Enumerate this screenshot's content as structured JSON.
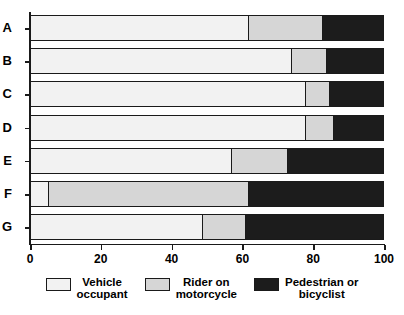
{
  "chart_data": {
    "type": "bar",
    "orientation": "horizontal",
    "stacked": true,
    "normalized_percent": true,
    "title": "",
    "xlabel": "",
    "ylabel": "",
    "xlim": [
      0,
      100
    ],
    "grid": false,
    "legend_position": "bottom",
    "categories": [
      "A",
      "B",
      "C",
      "D",
      "E",
      "F",
      "G"
    ],
    "series": [
      {
        "name": "Vehicle occupant",
        "color": "#f2f2f2",
        "values": [
          62,
          74,
          78,
          78,
          57,
          5,
          49
        ]
      },
      {
        "name": "Rider on motorcycle",
        "color": "#d6d6d6",
        "values": [
          21,
          10,
          7,
          8,
          16,
          57,
          12
        ]
      },
      {
        "name": "Pedestrian or bicyclist",
        "color": "#1c1c1c",
        "values": [
          17,
          16,
          15,
          14,
          27,
          38,
          39
        ]
      }
    ],
    "cumulative_boundaries": [
      [
        62,
        83
      ],
      [
        74,
        84
      ],
      [
        78,
        85
      ],
      [
        78,
        86
      ],
      [
        57,
        73
      ],
      [
        5,
        62
      ],
      [
        49,
        61
      ]
    ],
    "xticks": [
      0,
      20,
      40,
      60,
      80,
      100
    ],
    "xtick_labels": [
      "0",
      "20",
      "40",
      "60",
      "80",
      "100"
    ],
    "ytick_labels": [
      "A",
      "B",
      "C",
      "D",
      "E",
      "F",
      "G"
    ]
  },
  "legend": {
    "items": [
      {
        "label": "Vehicle\noccupant",
        "swatch": "sw-1"
      },
      {
        "label": "Rider on\nmotorcycle",
        "swatch": "sw-2"
      },
      {
        "label": "Pedestrian or\nbicyclist",
        "swatch": "sw-3"
      }
    ]
  }
}
